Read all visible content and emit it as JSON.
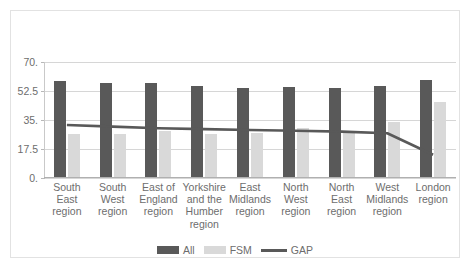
{
  "chart_data": {
    "type": "bar",
    "title": "",
    "xlabel": "",
    "ylabel": "",
    "ylim": [
      0,
      70
    ],
    "yticks": [
      0,
      17.5,
      35,
      52.5,
      70
    ],
    "ytick_labels": [
      "0.",
      "17.5",
      "35.",
      "52.5",
      "70."
    ],
    "grid": true,
    "legend_position": "bottom",
    "categories": [
      "South East region",
      "South West region",
      "East of England region",
      "Yorkshire and the Humber region",
      "East Midlands region",
      "North West region",
      "North East region",
      "West Midlands region",
      "London region"
    ],
    "category_lines": [
      [
        "South",
        "East",
        "region"
      ],
      [
        "South",
        "West",
        "region"
      ],
      [
        "East of",
        "England",
        "region"
      ],
      [
        "Yorkshire",
        "and the",
        "Humber",
        "region"
      ],
      [
        "East",
        "Midlands",
        "region"
      ],
      [
        "North",
        "West",
        "region"
      ],
      [
        "North",
        "East",
        "region"
      ],
      [
        "West",
        "Midlands",
        "region"
      ],
      [
        "London",
        "region"
      ]
    ],
    "series": [
      {
        "name": "All",
        "kind": "bar",
        "color": "#595959",
        "values": [
          58.0,
          56.5,
          56.5,
          55.0,
          53.5,
          54.5,
          54.0,
          55.0,
          58.5
        ]
      },
      {
        "name": "FSM",
        "kind": "bar",
        "color": "#d9d9d9",
        "values": [
          26.0,
          26.0,
          27.5,
          26.0,
          26.5,
          29.5,
          27.5,
          33.0,
          45.0
        ]
      },
      {
        "name": "GAP",
        "kind": "line",
        "color": "#595959",
        "values": [
          32.0,
          31.0,
          30.0,
          29.5,
          29.0,
          28.5,
          28.0,
          27.0,
          14.0
        ]
      }
    ]
  },
  "legend": {
    "items": [
      {
        "label": "All",
        "marker": "bar-swatch-dark"
      },
      {
        "label": "FSM",
        "marker": "bar-swatch-light"
      },
      {
        "label": "GAP",
        "marker": "line-swatch"
      }
    ]
  },
  "colors": {
    "all_bar": "#595959",
    "fsm_bar": "#d9d9d9",
    "gap_line": "#595959",
    "gridline": "#d6d6d6",
    "text": "#6d6d6d",
    "frame": "#e2e2e2",
    "background": "#ffffff"
  }
}
